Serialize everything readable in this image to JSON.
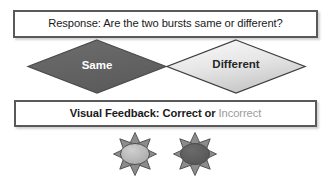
{
  "diagram": {
    "background_color": "#ffffff"
  },
  "response_box": {
    "text": "Response: Are the two bursts same or different?"
  },
  "options": {
    "same": {
      "label": "Same",
      "fill": "#636363",
      "stroke": "#3f3f3f",
      "text_color": "#ffffff"
    },
    "different": {
      "label": "Different",
      "fill": "#e3e3e3",
      "stroke": "#3f3f3f",
      "text_color": "#262626"
    }
  },
  "feedback_box": {
    "prefix": "Visual Feedback: ",
    "correct_label": "Correct",
    "conjunction": " or ",
    "incorrect_label": "Incorrect",
    "correct_color": "#1a1a1a",
    "incorrect_color": "#9c9c9c"
  },
  "bursts": [
    {
      "name": "burst-left",
      "center_fill": "#b3b3b3",
      "ray_fill": "#8c8c8c",
      "stroke": "#4d4d4d",
      "ray_count": 8
    },
    {
      "name": "burst-right",
      "center_fill": "#5e5e5e",
      "ray_fill": "#8c8c8c",
      "stroke": "#4d4d4d",
      "ray_count": 8
    }
  ]
}
